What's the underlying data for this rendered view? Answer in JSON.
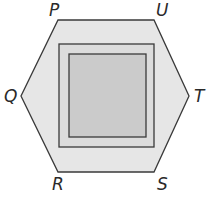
{
  "diagram": {
    "hexagon": {
      "fill": "#e6e6e6",
      "stroke": "#3a3a3a",
      "points": [
        [
          58,
          20
        ],
        [
          154,
          20
        ],
        [
          189,
          96
        ],
        [
          154,
          172
        ],
        [
          58,
          172
        ],
        [
          21,
          96
        ]
      ]
    },
    "outer_square": {
      "x": 59,
      "y": 44,
      "width": 95,
      "height": 103,
      "fill": "#dcdcdc",
      "stroke": "#3a3a3a"
    },
    "inner_square": {
      "x": 69,
      "y": 54,
      "width": 77,
      "height": 83,
      "fill": "#cbcbcb",
      "stroke": "#3a3a3a"
    },
    "labels": {
      "P": "P",
      "U": "U",
      "T": "T",
      "S": "S",
      "R": "R",
      "Q": "Q"
    }
  }
}
